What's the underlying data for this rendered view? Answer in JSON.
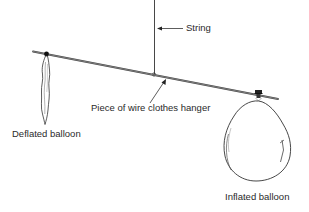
{
  "diagram": {
    "labels": {
      "string": "String",
      "wire": "Piece of wire clothes hanger",
      "deflated": "Deflated balloon",
      "inflated": "Inflated balloon"
    },
    "colors": {
      "line": "#2b2b2b",
      "wire": "#555555",
      "background": "#ffffff"
    }
  }
}
